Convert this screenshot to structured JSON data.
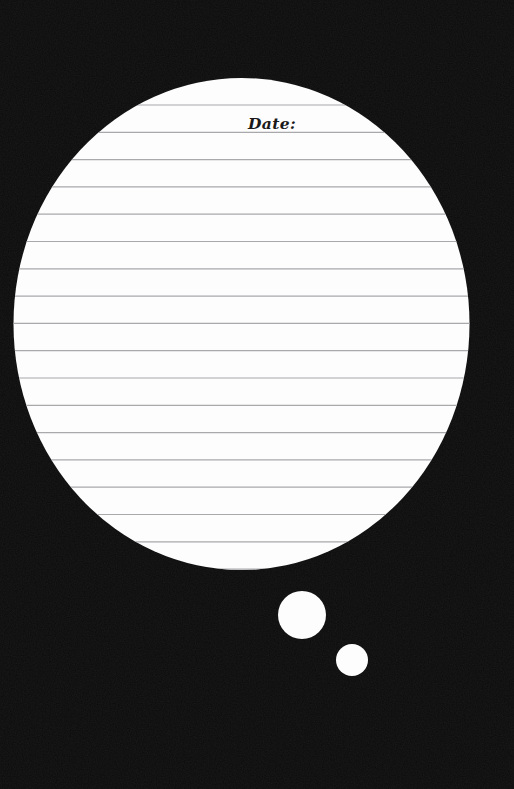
{
  "page": {
    "width": 514,
    "height": 789,
    "background_color": "#0d0c0c",
    "paper_color": "#fdfdfd",
    "rule_line_color": "#a8a8ad",
    "ink_color": "#1a1a1a"
  },
  "bubble": {
    "name": "thought-bubble",
    "main": {
      "cx": 241.5,
      "cy": 324,
      "rx": 228,
      "ry": 246
    },
    "tails": [
      {
        "name": "thought-bubble-tail-large",
        "cx": 302,
        "cy": 615,
        "r": 24
      },
      {
        "name": "thought-bubble-tail-small",
        "cx": 352,
        "cy": 660,
        "r": 16
      }
    ]
  },
  "ruled_lines": {
    "first_y": 105,
    "spacing": 27.3,
    "count": 18,
    "y_positions": [
      105,
      132.3,
      159.6,
      186.9,
      214.2,
      241.5,
      268.8,
      296.1,
      323.4,
      350.7,
      378,
      405.3,
      432.6,
      459.9,
      487.2,
      514.5,
      541.8,
      569.1
    ]
  },
  "fields": {
    "date_label": "Date:",
    "date_label_x": 272,
    "date_label_baseline_y": 129
  }
}
